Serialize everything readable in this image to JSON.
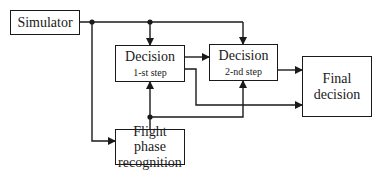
{
  "diagram": {
    "type": "block-diagram",
    "nodes": {
      "simulator": {
        "label": "Simulator"
      },
      "decision1": {
        "label": "Decision",
        "sublabel": "1-st step"
      },
      "decision2": {
        "label": "Decision",
        "sublabel": "2-nd step"
      },
      "final": {
        "label_line1": "Final",
        "label_line2": "decision"
      },
      "flight": {
        "label_line1": "Flight phase",
        "label_line2": "recognition"
      }
    },
    "edges": [
      {
        "from": "simulator",
        "to": "decision1"
      },
      {
        "from": "simulator",
        "to": "decision2"
      },
      {
        "from": "simulator",
        "to": "flight"
      },
      {
        "from": "decision1",
        "to": "decision2"
      },
      {
        "from": "decision1",
        "to": "final"
      },
      {
        "from": "decision2",
        "to": "final"
      },
      {
        "from": "flight",
        "to": "decision1"
      },
      {
        "from": "flight",
        "to": "decision2"
      }
    ],
    "colors": {
      "stroke": "#1a1a1a",
      "background": "#ffffff"
    }
  }
}
